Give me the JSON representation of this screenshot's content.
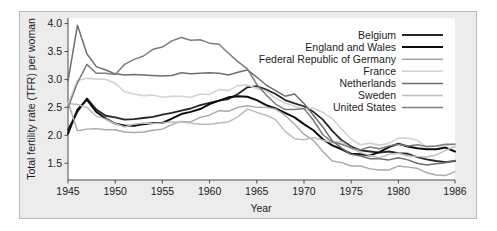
{
  "figure": {
    "background_color": "#ececec",
    "plot_background_color": "#ffffff",
    "frame_color": "#b9b9b9"
  },
  "chart_data": {
    "type": "line",
    "title": "",
    "xlabel": "Year",
    "ylabel": "Total fertility rate (TFR) per woman",
    "xlim": [
      1945,
      1986
    ],
    "ylim": [
      1.2,
      4.1
    ],
    "grid": false,
    "legend_position": "top-right",
    "xticks": [
      1945,
      1950,
      1955,
      1960,
      1965,
      1970,
      1975,
      1980,
      1986
    ],
    "xtick_labels": [
      "1945",
      "1950",
      "1955",
      "1960",
      "1965",
      "1970",
      "1975",
      "1980",
      "1986"
    ],
    "yticks": [
      1.5,
      2.0,
      2.5,
      3.0,
      3.5,
      4.0
    ],
    "ytick_labels": [
      "1.5",
      "2.0",
      "2.5",
      "3.0",
      "3.5",
      "4.0"
    ],
    "x": [
      1945,
      1946,
      1947,
      1948,
      1949,
      1950,
      1951,
      1952,
      1953,
      1954,
      1955,
      1956,
      1957,
      1958,
      1959,
      1960,
      1961,
      1962,
      1963,
      1964,
      1965,
      1966,
      1967,
      1968,
      1969,
      1970,
      1971,
      1972,
      1973,
      1974,
      1975,
      1976,
      1977,
      1978,
      1979,
      1980,
      1981,
      1982,
      1983,
      1984,
      1985,
      1986
    ],
    "series": [
      {
        "name": "Belgium",
        "color": "#262626",
        "width": 1.8,
        "values": [
          2.1,
          2.42,
          2.66,
          2.46,
          2.35,
          2.32,
          2.28,
          2.29,
          2.31,
          2.33,
          2.37,
          2.4,
          2.44,
          2.48,
          2.54,
          2.58,
          2.62,
          2.65,
          2.74,
          2.86,
          2.88,
          2.82,
          2.74,
          2.63,
          2.57,
          2.52,
          2.42,
          2.28,
          2.08,
          1.91,
          1.8,
          1.73,
          1.71,
          1.69,
          1.71,
          1.68,
          1.67,
          1.61,
          1.57,
          1.54,
          1.52,
          1.54
        ]
      },
      {
        "name": "England and Wales",
        "color": "#0d0d0d",
        "width": 2.0,
        "values": [
          2.03,
          2.46,
          2.64,
          2.42,
          2.3,
          2.21,
          2.17,
          2.17,
          2.2,
          2.22,
          2.22,
          2.3,
          2.38,
          2.42,
          2.47,
          2.56,
          2.62,
          2.68,
          2.7,
          2.69,
          2.63,
          2.54,
          2.48,
          2.4,
          2.32,
          2.2,
          2.09,
          1.93,
          1.82,
          1.75,
          1.67,
          1.66,
          1.64,
          1.7,
          1.79,
          1.85,
          1.8,
          1.77,
          1.75,
          1.75,
          1.78,
          1.71
        ]
      },
      {
        "name": "Federal Republic of Germany",
        "color": "#a8a8a8",
        "width": 1.4,
        "values": [
          2.6,
          2.08,
          2.11,
          2.12,
          2.1,
          2.1,
          2.06,
          2.05,
          2.06,
          2.09,
          2.11,
          2.19,
          2.25,
          2.24,
          2.32,
          2.36,
          2.44,
          2.43,
          2.5,
          2.53,
          2.5,
          2.5,
          2.47,
          2.36,
          2.2,
          2.02,
          1.91,
          1.71,
          1.54,
          1.51,
          1.45,
          1.45,
          1.4,
          1.38,
          1.38,
          1.45,
          1.43,
          1.41,
          1.33,
          1.29,
          1.28,
          1.35
        ]
      },
      {
        "name": "France",
        "color": "#d2d2d2",
        "width": 1.6,
        "values": [
          2.56,
          2.98,
          3.02,
          3.01,
          3.0,
          2.93,
          2.78,
          2.74,
          2.71,
          2.72,
          2.68,
          2.7,
          2.7,
          2.68,
          2.74,
          2.73,
          2.82,
          2.8,
          2.89,
          2.9,
          2.84,
          2.79,
          2.66,
          2.58,
          2.52,
          2.47,
          2.49,
          2.41,
          2.3,
          2.11,
          1.93,
          1.83,
          1.86,
          1.82,
          1.86,
          1.95,
          1.95,
          1.91,
          1.79,
          1.81,
          1.82,
          1.84
        ]
      },
      {
        "name": "Netherlands",
        "color": "#6e6e6e",
        "width": 1.5,
        "values": [
          2.97,
          3.97,
          3.46,
          3.23,
          3.17,
          3.1,
          3.08,
          3.09,
          3.08,
          3.07,
          3.06,
          3.07,
          3.12,
          3.1,
          3.11,
          3.12,
          3.11,
          3.08,
          3.13,
          3.17,
          3.04,
          2.9,
          2.8,
          2.7,
          2.74,
          2.57,
          2.36,
          2.15,
          1.9,
          1.77,
          1.66,
          1.63,
          1.58,
          1.58,
          1.56,
          1.6,
          1.56,
          1.5,
          1.47,
          1.49,
          1.51,
          1.55
        ]
      },
      {
        "name": "Sweden",
        "color": "#bdbdbd",
        "width": 1.5,
        "values": [
          2.57,
          2.55,
          2.5,
          2.34,
          2.29,
          2.21,
          2.15,
          2.2,
          2.22,
          2.21,
          2.22,
          2.24,
          2.24,
          2.22,
          2.2,
          2.2,
          2.22,
          2.24,
          2.33,
          2.47,
          2.41,
          2.36,
          2.28,
          2.07,
          1.94,
          1.92,
          1.96,
          1.91,
          1.87,
          1.89,
          1.77,
          1.69,
          1.64,
          1.6,
          1.66,
          1.68,
          1.63,
          1.62,
          1.61,
          1.65,
          1.73,
          1.8
        ]
      },
      {
        "name": "United States",
        "color": "#7d7d7d",
        "width": 1.5,
        "values": [
          2.49,
          2.94,
          3.27,
          3.11,
          3.11,
          3.09,
          3.27,
          3.36,
          3.42,
          3.54,
          3.58,
          3.69,
          3.75,
          3.7,
          3.71,
          3.65,
          3.63,
          3.47,
          3.32,
          3.19,
          2.91,
          2.72,
          2.56,
          2.46,
          2.46,
          2.48,
          2.27,
          2.01,
          1.88,
          1.84,
          1.77,
          1.74,
          1.79,
          1.76,
          1.81,
          1.84,
          1.81,
          1.83,
          1.8,
          1.81,
          1.84,
          1.84
        ]
      }
    ],
    "legend_entries": [
      {
        "label": "Belgium",
        "color": "#262626",
        "width": 1.8
      },
      {
        "label": "England and Wales",
        "color": "#0d0d0d",
        "width": 2.0
      },
      {
        "label": "Federal Republic of Germany",
        "color": "#a8a8a8",
        "width": 1.4
      },
      {
        "label": "France",
        "color": "#d2d2d2",
        "width": 1.6
      },
      {
        "label": "Netherlands",
        "color": "#6e6e6e",
        "width": 1.5
      },
      {
        "label": "Sweden",
        "color": "#bdbdbd",
        "width": 1.5
      },
      {
        "label": "United States",
        "color": "#7d7d7d",
        "width": 1.5
      }
    ]
  }
}
